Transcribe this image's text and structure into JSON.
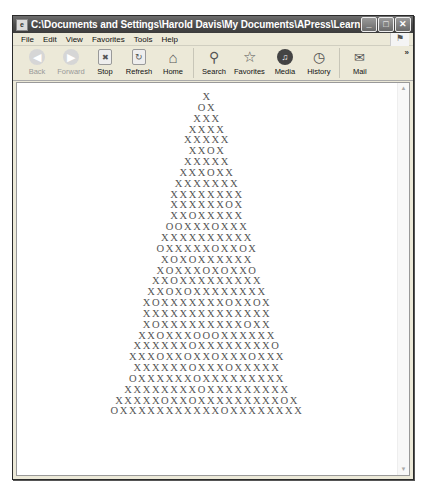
{
  "window": {
    "title": "C:\\Documents and Settings\\Harold Davis\\My Documents\\APress\\Learn How to Program\\04ch\\tre...",
    "controls": {
      "minimize": "_",
      "maximize": "□",
      "close": "✕"
    }
  },
  "menubar": {
    "items": [
      "File",
      "Edit",
      "View",
      "Favorites",
      "Tools",
      "Help"
    ]
  },
  "toolbar": {
    "buttons": [
      {
        "label": "Back",
        "icon": "back-arrow-icon",
        "glyph": "◀",
        "disabled": true
      },
      {
        "label": "Forward",
        "icon": "forward-arrow-icon",
        "glyph": "▶",
        "disabled": true
      },
      {
        "label": "Stop",
        "icon": "stop-icon",
        "glyph": "✖"
      },
      {
        "label": "Refresh",
        "icon": "refresh-icon",
        "glyph": "↻"
      },
      {
        "label": "Home",
        "icon": "home-icon",
        "glyph": "⌂"
      },
      {
        "label": "Search",
        "icon": "search-icon",
        "glyph": "⚲"
      },
      {
        "label": "Favorites",
        "icon": "star-icon",
        "glyph": "☆"
      },
      {
        "label": "Media",
        "icon": "media-icon",
        "glyph": "♫"
      },
      {
        "label": "History",
        "icon": "history-icon",
        "glyph": "◷"
      },
      {
        "label": "Mail",
        "icon": "mail-icon",
        "glyph": "✉"
      }
    ],
    "overflow": "»"
  },
  "content": {
    "tree_rows": [
      "X",
      "OX",
      "XXX",
      "XXXX",
      "XXXXX",
      "XXOX",
      "XXXXX",
      "XXXOXX",
      "XXXXXXX",
      "XXXXXXXX",
      "XXXXXXOX",
      "XXOXXXXX",
      "OOXXXOXXX",
      "XXXXXXXXXX",
      "OXXXXXOXXOX",
      "XOXOXXXXXX",
      "XOXXXOXOXXO",
      "XXOXXXXXXXXX",
      "XXOXOXXXXXXXX",
      "XOXXXXXXXOXXOX",
      "XXXXXXXXXXXXXX",
      "XOXXXXXXXXXOXX",
      "XXOXXXOOOXXXXXX",
      "XXXXXXOXXXXXXXXO",
      "XXXOXXOXXOXXXOXXX",
      "XXXXXXOXXXOXXXXX",
      "OXXXXXXOXXXXXXXXX",
      "XXXXXXXXOXXXXXXXXX",
      "XXXXXOXXOXXXXXXXXXOX",
      "OXXXXXXXXXXXOXXXXXXXX"
    ]
  }
}
